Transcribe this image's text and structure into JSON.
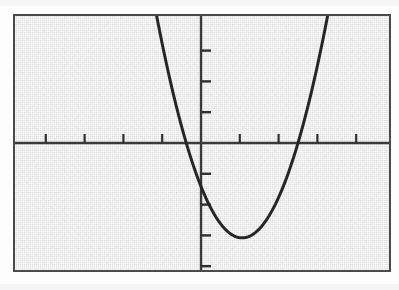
{
  "figure": {
    "kind": "graphing-calculator-screen",
    "frame": {
      "left": 13,
      "top": 14,
      "width": 378,
      "height": 258,
      "border_color": "#4a4a4a",
      "border_width": 2,
      "background_color": "#e9e9e9"
    }
  },
  "chart_data": {
    "type": "line",
    "title": "",
    "subtitle": "",
    "xlabel": "",
    "ylabel": "",
    "function": "y = 1.2x^2 - 2.14x - 2.15",
    "curve_kind": "parabola",
    "opens": "upward",
    "vertex": {
      "x": 1.06,
      "y": -3.08
    },
    "x_intercepts": [
      -0.72,
      2.5
    ],
    "y_intercept": -2.08,
    "axis_of_symmetry": 1.06,
    "grid": false,
    "legend": null,
    "axes": {
      "x_axis_visible": true,
      "y_axis_visible": true,
      "axis_color": "#3a3a3a",
      "axis_width": 2,
      "origin_pixel": {
        "x": 201,
        "y": 143
      },
      "x_unit_pixels": 38.8,
      "y_unit_pixels": 30.8
    },
    "xlim": [
      -4.85,
      4.9
    ],
    "ylim": [
      -4.19,
      4.19
    ],
    "xticks": [
      -4,
      -3,
      -2,
      -1,
      1,
      2,
      3,
      4
    ],
    "yticks": [
      -4,
      -3,
      -2,
      -1,
      1,
      2,
      3
    ],
    "xtick_labels": [],
    "ytick_labels": [],
    "tick_mark_length": 9,
    "tick_color": "#2f2f2f",
    "series": [
      {
        "name": "parabola",
        "color": "#262626",
        "line_width": 3,
        "x": [
          -0.22,
          0.0,
          0.25,
          0.5,
          0.75,
          1.06,
          1.25,
          1.5,
          1.75,
          2.0,
          2.25,
          2.5,
          2.75,
          3.0,
          3.25,
          3.58
        ],
        "y": [
          -1.61,
          -2.08,
          -2.66,
          -3.0,
          -3.12,
          -3.08,
          -3.0,
          -2.63,
          -2.0,
          -1.12,
          0.01,
          1.39,
          3.02,
          3.98,
          4.19,
          4.19
        ]
      }
    ],
    "annotations": []
  }
}
